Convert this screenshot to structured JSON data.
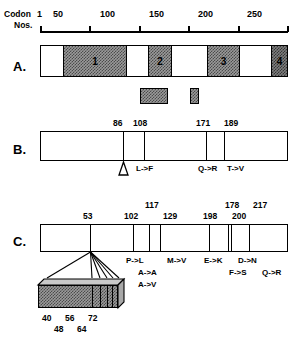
{
  "figure": {
    "axis": {
      "label_line1": "Codon",
      "label_line2": "Nos.",
      "origin_tick": "1",
      "ticks": [
        "50",
        "100",
        "150",
        "200",
        "250"
      ],
      "range_min": 1,
      "range_max": 250
    },
    "panels": [
      {
        "id": "A",
        "letter": "A.",
        "type": "domain-map",
        "blocks": [
          {
            "label": "1",
            "start": 50,
            "end": 100
          },
          {
            "label": "2",
            "start": 121,
            "end": 140
          },
          {
            "label": "3",
            "start": 158,
            "end": 186
          },
          {
            "label": "4",
            "start": 213,
            "end": 228
          }
        ],
        "sub_boxes": [
          {
            "start": 116,
            "end": 140
          },
          {
            "start": 160,
            "end": 168
          }
        ]
      },
      {
        "id": "B",
        "letter": "B.",
        "type": "mutation-map",
        "markers": [
          {
            "codon": "86",
            "mutation": "",
            "insertion": true
          },
          {
            "codon": "108",
            "mutation": "L->F",
            "insertion": false
          },
          {
            "codon": "171",
            "mutation": "Q->R",
            "insertion": false
          },
          {
            "codon": "189",
            "mutation": "T->V",
            "insertion": false
          }
        ]
      },
      {
        "id": "C",
        "letter": "C.",
        "type": "mutation-map",
        "markers": [
          {
            "codon": "53",
            "row": 0,
            "mutation": "",
            "mutation_row": 0
          },
          {
            "codon": "102",
            "row": 0,
            "mutation": "P->L",
            "mutation_row": 0
          },
          {
            "codon": "117",
            "row": 1,
            "mutation": "A->A",
            "mutation_row": 1
          },
          {
            "codon": "129",
            "row": 0,
            "mutation": "A->V",
            "mutation_row": 2
          },
          {
            "codon": "178",
            "row": 0,
            "mutation": "D->N",
            "mutation_row": 0
          },
          {
            "codon": "198",
            "row": 1,
            "mutation": "E->K",
            "mutation_row": 0
          },
          {
            "codon": "200",
            "row": 0,
            "mutation": "F->S",
            "mutation_row": 1
          },
          {
            "codon": "217",
            "row": 1,
            "mutation": "Q->R",
            "mutation_row": 1
          }
        ],
        "extra_mutations": [
          {
            "label": "M->V"
          }
        ],
        "expansion": {
          "source_codon": "53",
          "sub_positions": [
            "40",
            "48",
            "56",
            "64",
            "72"
          ],
          "top_row": [
            "40",
            "56",
            "72"
          ],
          "bottom_row": [
            "48",
            "64"
          ]
        }
      }
    ]
  }
}
